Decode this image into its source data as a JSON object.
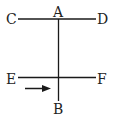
{
  "diagram": {
    "type": "wire-geometry",
    "labels": {
      "A": "A",
      "B": "B",
      "C": "C",
      "D": "D",
      "E": "E",
      "F": "F"
    },
    "segments": [
      {
        "name": "CD",
        "from": "C",
        "to": "D",
        "orientation": "horizontal"
      },
      {
        "name": "AB",
        "from": "A",
        "to": "B",
        "orientation": "vertical"
      },
      {
        "name": "EF",
        "from": "E",
        "to": "F",
        "orientation": "horizontal"
      }
    ],
    "arrow": {
      "direction": "right",
      "position": "below EF, left of AB"
    },
    "colors": {
      "line": "#1a1a1a",
      "text": "#222222",
      "background": "#ffffff"
    }
  }
}
